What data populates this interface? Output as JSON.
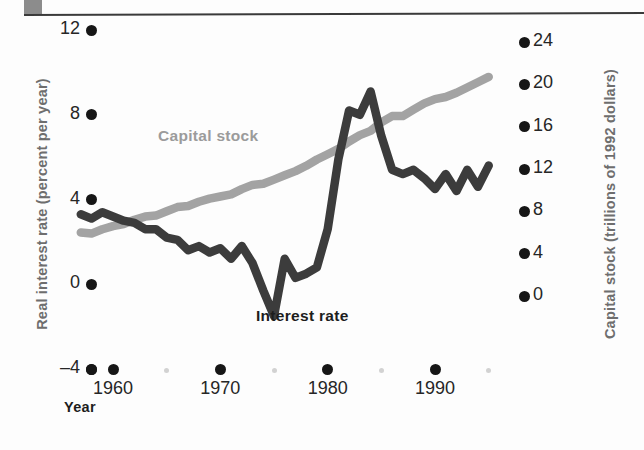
{
  "figure": {
    "xlabel": "Year",
    "ylabel_left": "Real interest rate (percent per year)",
    "ylabel_right": "Capital stock (trillions of 1992 dollars)"
  },
  "series_labels": {
    "capital_stock": "Capital stock",
    "interest_rate": "Interest rate"
  },
  "ticks": {
    "left": [
      "12",
      "8",
      "4",
      "0",
      "–4"
    ],
    "right": [
      "24",
      "20",
      "16",
      "12",
      "8",
      "4",
      "0"
    ],
    "x": [
      "1960",
      "1970",
      "1980",
      "1990"
    ]
  },
  "chart_data": {
    "type": "line",
    "title": "",
    "xlabel": "Year",
    "ylabel": "Real interest rate (percent per year)",
    "ylabel_secondary": "Capital stock (trillions of 1992 dollars)",
    "xlim": [
      1955,
      1996
    ],
    "ylim": [
      -4,
      12
    ],
    "ylim_secondary": [
      0,
      24
    ],
    "xticks": [
      1960,
      1970,
      1980,
      1990
    ],
    "yticks": [
      -4,
      0,
      4,
      8,
      12
    ],
    "yticks_secondary": [
      0,
      4,
      8,
      12,
      16,
      20,
      24
    ],
    "xtick_minor": [
      1965,
      1975,
      1985,
      1995
    ],
    "grid": false,
    "legend": "inline-labels",
    "series": [
      {
        "name": "Capital stock",
        "axis": "right",
        "color": "#a3a3a3",
        "x": [
          1957,
          1958,
          1959,
          1960,
          1961,
          1962,
          1963,
          1964,
          1965,
          1966,
          1967,
          1968,
          1969,
          1970,
          1971,
          1972,
          1973,
          1974,
          1975,
          1976,
          1977,
          1978,
          1979,
          1980,
          1981,
          1982,
          1983,
          1984,
          1985,
          1986,
          1987,
          1988,
          1989,
          1990,
          1991,
          1992,
          1993,
          1994,
          1995
        ],
        "values": [
          6.0,
          5.9,
          6.3,
          6.6,
          6.8,
          7.2,
          7.5,
          7.6,
          8.0,
          8.4,
          8.5,
          8.9,
          9.2,
          9.4,
          9.6,
          10.1,
          10.5,
          10.6,
          11.0,
          11.4,
          11.8,
          12.3,
          12.9,
          13.4,
          13.9,
          14.6,
          15.2,
          15.6,
          16.4,
          17.0,
          17.0,
          17.6,
          18.2,
          18.6,
          18.8,
          19.2,
          19.7,
          20.2,
          20.7
        ]
      },
      {
        "name": "Interest rate",
        "axis": "left",
        "color": "#3c3c3c",
        "x": [
          1957,
          1958,
          1959,
          1960,
          1961,
          1962,
          1963,
          1964,
          1965,
          1966,
          1967,
          1968,
          1969,
          1970,
          1971,
          1972,
          1973,
          1974,
          1975,
          1976,
          1977,
          1978,
          1979,
          1980,
          1981,
          1982,
          1983,
          1984,
          1985,
          1986,
          1987,
          1988,
          1989,
          1990,
          1991,
          1992,
          1993,
          1994,
          1995
        ],
        "values": [
          3.3,
          3.1,
          3.4,
          3.2,
          3.0,
          2.9,
          2.6,
          2.6,
          2.2,
          2.1,
          1.6,
          1.8,
          1.5,
          1.7,
          1.2,
          1.8,
          1.0,
          -0.3,
          -1.5,
          1.2,
          0.3,
          0.5,
          0.8,
          2.6,
          5.9,
          8.2,
          8.0,
          9.1,
          7.0,
          5.4,
          5.2,
          5.4,
          5.0,
          4.5,
          5.2,
          4.4,
          5.4,
          4.6,
          5.6
        ]
      }
    ]
  }
}
